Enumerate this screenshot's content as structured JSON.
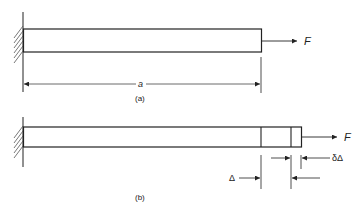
{
  "figure": {
    "top_fragment": "...",
    "panel_a": {
      "caption": "(a)",
      "force_label": "F",
      "length_label": "a"
    },
    "panel_b": {
      "caption": "(b)",
      "force_label": "F",
      "extension_label": "Δ",
      "increment_label": "δΔ"
    }
  },
  "colors": {
    "line": "#222222",
    "hatch": "#555555",
    "background": "#ffffff"
  }
}
